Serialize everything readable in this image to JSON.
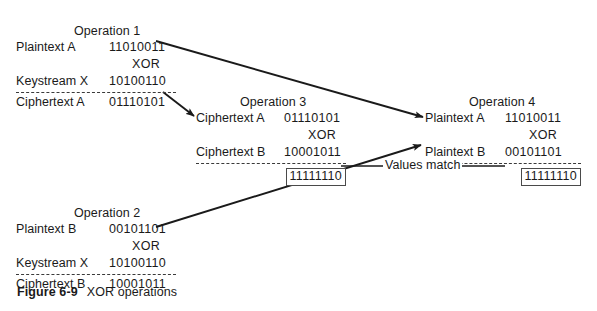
{
  "figure": {
    "caption_label": "Figure 6-9",
    "caption_text": "XOR operations",
    "annotation": "Values match",
    "line_color": "#1a1a1a",
    "background": "#ffffff"
  },
  "operations": [
    {
      "id": "op1",
      "title": "Operation 1",
      "operand1_label": "Plaintext A",
      "operand1_value": "11010011",
      "operator": "XOR",
      "operand2_label": "Keystream X",
      "operand2_value": "10100110",
      "result_label": "Ciphertext A",
      "result_value": "01110101",
      "result_boxed": false
    },
    {
      "id": "op2",
      "title": "Operation 2",
      "operand1_label": "Plaintext B",
      "operand1_value": "00101101",
      "operator": "XOR",
      "operand2_label": "Keystream X",
      "operand2_value": "10100110",
      "result_label": "Ciphertext B",
      "result_value": "10001011",
      "result_boxed": false
    },
    {
      "id": "op3",
      "title": "Operation 3",
      "operand1_label": "Ciphertext A",
      "operand1_value": "01110101",
      "operator": "XOR",
      "operand2_label": "Ciphertext B",
      "operand2_value": "10001011",
      "result_label": "",
      "result_value": "11111110",
      "result_boxed": true
    },
    {
      "id": "op4",
      "title": "Operation 4",
      "operand1_label": "Plaintext A",
      "operand1_value": "11010011",
      "operator": "XOR",
      "operand2_label": "Plaintext B",
      "operand2_value": "00101101",
      "result_label": "",
      "result_value": "11111110",
      "result_boxed": true
    }
  ],
  "connectors": [
    {
      "name": "op1-plaintext-a-to-op4-plaintext-a",
      "from": "Operation 1 Plaintext A",
      "to": "Operation 4 Plaintext A"
    },
    {
      "name": "op1-ciphertext-a-to-op3-ciphertext-a",
      "from": "Operation 1 Ciphertext A",
      "to": "Operation 3 Ciphertext A"
    },
    {
      "name": "op2-plaintext-b-to-op4-plaintext-b",
      "from": "Operation 2 Plaintext B",
      "to": "Operation 4 Plaintext B"
    },
    {
      "name": "values-match-link",
      "from": "Operation 3 result",
      "to": "Operation 4 result"
    }
  ]
}
